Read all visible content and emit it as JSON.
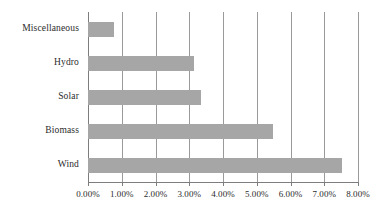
{
  "chart_data": {
    "type": "bar",
    "orientation": "horizontal",
    "title": "",
    "subtitle": "",
    "xlabel": "",
    "ylabel": "",
    "categories": [
      "Miscellaneous",
      "Hydro",
      "Solar",
      "Biomass",
      "Wind"
    ],
    "values": [
      0.77,
      3.14,
      3.35,
      5.47,
      7.54
    ],
    "value_format": "percent",
    "xlim": [
      0,
      8
    ],
    "xticks": [
      0,
      1,
      2,
      3,
      4,
      5,
      6,
      7,
      8
    ],
    "xtick_labels": [
      "0.00%",
      "1.00%",
      "2.00%",
      "3.00%",
      "4.00%",
      "5.00%",
      "6.00%",
      "7.00%",
      "8.00%"
    ],
    "grid": "vertical",
    "legend": "none",
    "bar_color": "#a6a6a6",
    "gridline_color": "#9a9a9a",
    "axis_color": "#7d7d7d",
    "text_color": "#2b2b2b"
  }
}
